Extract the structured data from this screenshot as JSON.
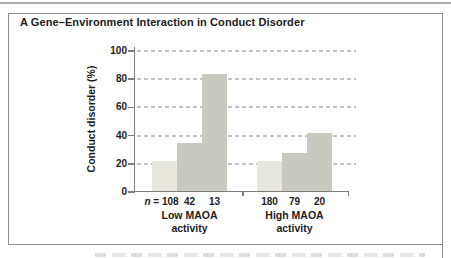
{
  "chart_data": {
    "type": "bar",
    "title": "A Gene–Environment Interaction in Conduct Disorder",
    "ylabel": "Conduct disorder (%)",
    "ylim": [
      0,
      100
    ],
    "yticks": [
      0,
      20,
      40,
      60,
      80,
      100
    ],
    "grid": "horizontal-dashed",
    "legend": "none",
    "n_prefix": {
      "italic": "n",
      "rest": " = "
    },
    "categories": [
      "Low MAOA activity",
      "High MAOA activity"
    ],
    "groups": [
      {
        "label_line1": "Low MAOA",
        "label_line2": "activity",
        "bars": [
          {
            "n": "108",
            "value": 22,
            "shade": "light"
          },
          {
            "n": "42",
            "value": 35,
            "shade": "dark"
          },
          {
            "n": "13",
            "value": 84,
            "shade": "dark"
          }
        ]
      },
      {
        "label_line1": "High MAOA",
        "label_line2": "activity",
        "bars": [
          {
            "n": "180",
            "value": 22,
            "shade": "light"
          },
          {
            "n": "79",
            "value": 28,
            "shade": "dark"
          },
          {
            "n": "20",
            "value": 42,
            "shade": "dark"
          }
        ]
      }
    ],
    "colors": {
      "light": "#e8e8df",
      "dark": "#c8cac1",
      "axis": "#7d7d7d",
      "grid": "#c3c3c3",
      "frame": "#8e8e8e",
      "text": "#1c1c1c"
    }
  }
}
